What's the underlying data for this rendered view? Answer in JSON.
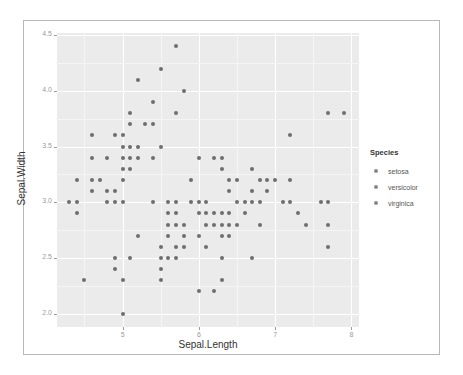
{
  "chart_data": {
    "type": "scatter",
    "title": "",
    "xlabel": "Sepal.Length",
    "ylabel": "Sepal.Width",
    "xlim": [
      4.14,
      8.1
    ],
    "ylim": [
      1.88,
      4.52
    ],
    "x_ticks": [
      5,
      6,
      7,
      8
    ],
    "x_tick_labels": [
      "5",
      "6",
      "7",
      "8"
    ],
    "y_ticks": [
      2.0,
      2.5,
      3.0,
      3.5,
      4.0,
      4.5
    ],
    "y_tick_labels": [
      "2.0",
      "2.5",
      "3.0",
      "3.5",
      "4.0",
      "4.5"
    ],
    "grid": true,
    "legend": {
      "title": "Species",
      "position": "right",
      "entries": [
        "setosa",
        "versicolor",
        "virginica"
      ]
    },
    "point_color": "#6e6e6e",
    "points": [
      [
        4.3,
        3.0
      ],
      [
        4.4,
        2.9
      ],
      [
        4.4,
        3.0
      ],
      [
        4.4,
        3.2
      ],
      [
        4.5,
        2.3
      ],
      [
        4.6,
        3.1
      ],
      [
        4.6,
        3.2
      ],
      [
        4.6,
        3.4
      ],
      [
        4.6,
        3.6
      ],
      [
        4.7,
        3.2
      ],
      [
        4.8,
        3.0
      ],
      [
        4.8,
        3.1
      ],
      [
        4.8,
        3.4
      ],
      [
        4.9,
        2.4
      ],
      [
        4.9,
        2.5
      ],
      [
        4.9,
        3.0
      ],
      [
        4.9,
        3.1
      ],
      [
        4.9,
        3.6
      ],
      [
        5.0,
        2.0
      ],
      [
        5.0,
        2.3
      ],
      [
        5.0,
        3.0
      ],
      [
        5.0,
        3.2
      ],
      [
        5.0,
        3.3
      ],
      [
        5.0,
        3.4
      ],
      [
        5.0,
        3.5
      ],
      [
        5.0,
        3.6
      ],
      [
        5.1,
        2.5
      ],
      [
        5.1,
        3.3
      ],
      [
        5.1,
        3.4
      ],
      [
        5.1,
        3.5
      ],
      [
        5.1,
        3.7
      ],
      [
        5.1,
        3.8
      ],
      [
        5.2,
        2.7
      ],
      [
        5.2,
        3.4
      ],
      [
        5.2,
        3.5
      ],
      [
        5.2,
        4.1
      ],
      [
        5.3,
        3.7
      ],
      [
        5.4,
        3.0
      ],
      [
        5.4,
        3.4
      ],
      [
        5.4,
        3.7
      ],
      [
        5.4,
        3.9
      ],
      [
        5.5,
        2.3
      ],
      [
        5.5,
        2.4
      ],
      [
        5.5,
        2.5
      ],
      [
        5.5,
        2.6
      ],
      [
        5.5,
        3.5
      ],
      [
        5.5,
        4.2
      ],
      [
        5.6,
        2.5
      ],
      [
        5.6,
        2.7
      ],
      [
        5.6,
        2.8
      ],
      [
        5.6,
        2.9
      ],
      [
        5.6,
        3.0
      ],
      [
        5.7,
        2.5
      ],
      [
        5.7,
        2.6
      ],
      [
        5.7,
        2.8
      ],
      [
        5.7,
        2.9
      ],
      [
        5.7,
        3.0
      ],
      [
        5.7,
        3.8
      ],
      [
        5.7,
        4.4
      ],
      [
        5.8,
        2.6
      ],
      [
        5.8,
        2.7
      ],
      [
        5.8,
        2.8
      ],
      [
        5.8,
        4.0
      ],
      [
        5.9,
        3.0
      ],
      [
        5.9,
        3.2
      ],
      [
        6.0,
        2.2
      ],
      [
        6.0,
        2.7
      ],
      [
        6.0,
        2.9
      ],
      [
        6.0,
        3.0
      ],
      [
        6.0,
        3.4
      ],
      [
        6.1,
        2.6
      ],
      [
        6.1,
        2.8
      ],
      [
        6.1,
        2.9
      ],
      [
        6.1,
        3.0
      ],
      [
        6.2,
        2.2
      ],
      [
        6.2,
        2.8
      ],
      [
        6.2,
        2.9
      ],
      [
        6.2,
        3.4
      ],
      [
        6.3,
        2.3
      ],
      [
        6.3,
        2.5
      ],
      [
        6.3,
        2.7
      ],
      [
        6.3,
        2.8
      ],
      [
        6.3,
        2.9
      ],
      [
        6.3,
        3.3
      ],
      [
        6.3,
        3.4
      ],
      [
        6.4,
        2.7
      ],
      [
        6.4,
        2.8
      ],
      [
        6.4,
        2.9
      ],
      [
        6.4,
        3.1
      ],
      [
        6.4,
        3.2
      ],
      [
        6.5,
        2.8
      ],
      [
        6.5,
        3.0
      ],
      [
        6.5,
        3.2
      ],
      [
        6.6,
        2.9
      ],
      [
        6.6,
        3.0
      ],
      [
        6.7,
        2.5
      ],
      [
        6.7,
        3.0
      ],
      [
        6.7,
        3.1
      ],
      [
        6.7,
        3.3
      ],
      [
        6.8,
        2.8
      ],
      [
        6.8,
        3.0
      ],
      [
        6.8,
        3.2
      ],
      [
        6.9,
        3.1
      ],
      [
        6.9,
        3.2
      ],
      [
        7.0,
        3.2
      ],
      [
        7.1,
        3.0
      ],
      [
        7.2,
        3.0
      ],
      [
        7.2,
        3.2
      ],
      [
        7.2,
        3.6
      ],
      [
        7.3,
        2.9
      ],
      [
        7.4,
        2.8
      ],
      [
        7.6,
        3.0
      ],
      [
        7.7,
        2.6
      ],
      [
        7.7,
        2.8
      ],
      [
        7.7,
        3.0
      ],
      [
        7.7,
        3.8
      ],
      [
        7.9,
        3.8
      ]
    ]
  },
  "axes": {
    "x_title": "Sepal.Length",
    "y_title": "Sepal.Width"
  },
  "legend": {
    "title": "Species",
    "items": [
      {
        "label": "setosa"
      },
      {
        "label": "versicolor"
      },
      {
        "label": "virginica"
      }
    ]
  }
}
